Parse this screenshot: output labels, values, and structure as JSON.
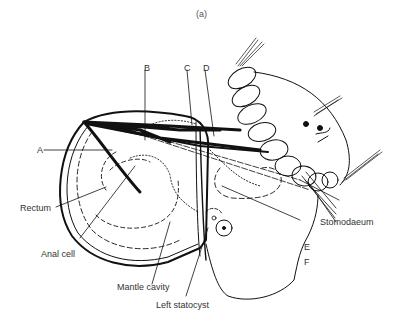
{
  "figure": {
    "panel_label": "(a)"
  },
  "labels": {
    "A": "A",
    "B": "B",
    "C": "C",
    "D": "D",
    "E": "E",
    "F": "F",
    "rectum": "Rectum",
    "anal_cell": "Anal cell",
    "mantle_cavity": "Mantle cavity",
    "left_statocyst": "Left statocyst",
    "stomodaeum": "Stomodaeum"
  }
}
